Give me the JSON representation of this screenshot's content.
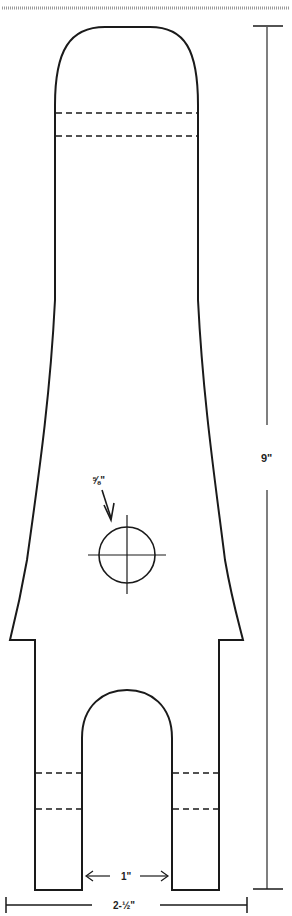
{
  "diagram": {
    "type": "technical-drawing",
    "colors": {
      "line": "#1a1a1a",
      "dimension": "#444444",
      "background": "#ffffff",
      "top_stripe": "#9a9a9a"
    },
    "dimensions": {
      "overall_height": "9\"",
      "overall_width": "2-½\"",
      "slot_width": "1\"",
      "hole_diameter": "⅝\""
    },
    "features": [
      "rounded-top",
      "dashed-fold-lines-top",
      "tapered-body",
      "center-hole-with-crosshair",
      "two-legs",
      "arched-slot",
      "dashed-fold-lines-legs"
    ]
  }
}
